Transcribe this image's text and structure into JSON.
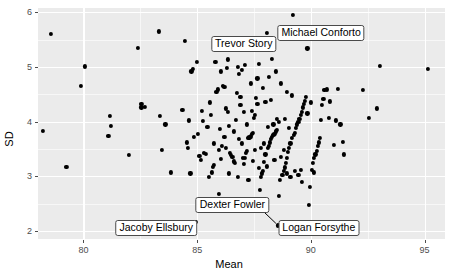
{
  "chart_data": {
    "type": "scatter",
    "title": "",
    "xlabel": "Mean",
    "ylabel": "SD",
    "xlim": [
      78.0,
      95.9
    ],
    "ylim": [
      1.85,
      6.08
    ],
    "xticks": [
      80,
      85,
      90,
      95
    ],
    "yticks": [
      2,
      3,
      4,
      5,
      6
    ],
    "xtick_labels": [
      "80",
      "85",
      "90",
      "95"
    ],
    "ytick_labels": [
      "2",
      "3",
      "4",
      "5",
      "6"
    ],
    "grid": true,
    "legend": "none",
    "panel_background": "#ebebeb",
    "grid_color": "#ffffff",
    "point_color": "#000000",
    "annotations": [
      {
        "label": "Trevor Story",
        "x": 87.05,
        "y": 5.42,
        "point_x": 88.05,
        "point_y": 5.63,
        "leader": false
      },
      {
        "label": "Michael Conforto",
        "x": 90.45,
        "y": 5.62,
        "point_x": 89.2,
        "point_y": 5.96,
        "leader": false
      },
      {
        "label": "Dexter Fowler",
        "x": 86.55,
        "y": 2.47,
        "point_x": 88.55,
        "point_y": 2.1,
        "leader": true
      },
      {
        "label": "Jacoby Ellsbury",
        "x": 83.2,
        "y": 2.06,
        "point_x": 84.95,
        "point_y": 2.16,
        "leader": false
      },
      {
        "label": "Logan Forsythe",
        "x": 90.35,
        "y": 2.06,
        "point_x": 88.7,
        "point_y": 2.1,
        "leader": false
      }
    ],
    "points": [
      [
        78.55,
        5.61
      ],
      [
        78.2,
        3.83
      ],
      [
        79.25,
        3.17
      ],
      [
        80.05,
        5.01
      ],
      [
        79.9,
        4.66
      ],
      [
        81.15,
        4.11
      ],
      [
        81.2,
        3.92
      ],
      [
        81.1,
        3.74
      ],
      [
        82.0,
        3.39
      ],
      [
        82.4,
        5.35
      ],
      [
        82.55,
        4.32
      ],
      [
        82.7,
        4.27
      ],
      [
        82.55,
        4.26
      ],
      [
        83.3,
        5.65
      ],
      [
        83.35,
        4.1
      ],
      [
        83.45,
        3.48
      ],
      [
        83.6,
        3.95
      ],
      [
        83.85,
        3.07
      ],
      [
        84.35,
        4.21
      ],
      [
        84.45,
        5.48
      ],
      [
        84.55,
        3.62
      ],
      [
        84.6,
        3.52
      ],
      [
        84.65,
        4.02
      ],
      [
        84.7,
        3.05
      ],
      [
        84.75,
        4.92
      ],
      [
        84.8,
        4.97
      ],
      [
        84.85,
        3.72
      ],
      [
        84.95,
        2.16
      ],
      [
        85.0,
        5.09
      ],
      [
        85.05,
        3.78
      ],
      [
        85.1,
        3.37
      ],
      [
        85.15,
        3.3
      ],
      [
        85.2,
        4.2
      ],
      [
        85.25,
        4.01
      ],
      [
        85.3,
        3.43
      ],
      [
        85.4,
        3.41
      ],
      [
        85.45,
        3.9
      ],
      [
        85.55,
        4.35
      ],
      [
        85.6,
        4.12
      ],
      [
        85.65,
        3.07
      ],
      [
        85.7,
        3.17
      ],
      [
        85.75,
        3.2
      ],
      [
        85.8,
        5.1
      ],
      [
        85.85,
        4.55
      ],
      [
        85.9,
        4.59
      ],
      [
        85.95,
        2.68
      ],
      [
        86.0,
        3.86
      ],
      [
        86.05,
        3.32
      ],
      [
        86.1,
        3.55
      ],
      [
        86.15,
        4.66
      ],
      [
        86.2,
        4.64
      ],
      [
        86.25,
        4.24
      ],
      [
        86.3,
        4.98
      ],
      [
        86.35,
        5.14
      ],
      [
        86.4,
        3.05
      ],
      [
        86.45,
        3.42
      ],
      [
        86.5,
        3.39
      ],
      [
        86.55,
        3.36
      ],
      [
        86.6,
        3.27
      ],
      [
        86.65,
        3.24
      ],
      [
        86.7,
        4.03
      ],
      [
        86.75,
        4.52
      ],
      [
        86.8,
        5.0
      ],
      [
        86.85,
        4.88
      ],
      [
        86.9,
        4.3
      ],
      [
        86.95,
        3.6
      ],
      [
        87.0,
        3.33
      ],
      [
        87.05,
        3.22
      ],
      [
        87.1,
        3.34
      ],
      [
        87.15,
        3.42
      ],
      [
        87.2,
        3.47
      ],
      [
        87.25,
        3.7
      ],
      [
        87.3,
        3.71
      ],
      [
        87.35,
        3.73
      ],
      [
        87.4,
        3.77
      ],
      [
        87.45,
        3.8
      ],
      [
        87.5,
        4.06
      ],
      [
        87.55,
        4.12
      ],
      [
        87.6,
        4.44
      ],
      [
        87.65,
        4.79
      ],
      [
        87.7,
        5.06
      ],
      [
        87.75,
        2.75
      ],
      [
        87.8,
        2.98
      ],
      [
        87.85,
        3.05
      ],
      [
        87.9,
        3.1
      ],
      [
        87.95,
        3.26
      ],
      [
        88.0,
        3.4
      ],
      [
        88.05,
        5.63
      ],
      [
        88.1,
        3.52
      ],
      [
        88.15,
        3.55
      ],
      [
        88.2,
        3.62
      ],
      [
        88.25,
        3.68
      ],
      [
        88.3,
        3.72
      ],
      [
        88.35,
        3.75
      ],
      [
        88.4,
        3.78
      ],
      [
        88.45,
        3.82
      ],
      [
        88.5,
        3.85
      ],
      [
        88.55,
        2.1
      ],
      [
        88.6,
        2.64
      ],
      [
        88.65,
        2.93
      ],
      [
        88.7,
        2.1
      ],
      [
        88.75,
        3.02
      ],
      [
        88.8,
        3.09
      ],
      [
        88.85,
        3.16
      ],
      [
        88.9,
        3.25
      ],
      [
        88.95,
        3.33
      ],
      [
        89.0,
        3.45
      ],
      [
        89.05,
        3.52
      ],
      [
        89.1,
        3.6
      ],
      [
        89.15,
        3.7
      ],
      [
        89.2,
        5.96
      ],
      [
        89.25,
        3.75
      ],
      [
        89.3,
        3.8
      ],
      [
        89.35,
        3.88
      ],
      [
        89.4,
        3.95
      ],
      [
        89.45,
        4.0
      ],
      [
        89.5,
        4.05
      ],
      [
        89.55,
        4.12
      ],
      [
        89.6,
        4.18
      ],
      [
        89.65,
        4.26
      ],
      [
        89.7,
        4.32
      ],
      [
        89.75,
        4.38
      ],
      [
        89.8,
        4.45
      ],
      [
        89.85,
        5.34
      ],
      [
        89.9,
        2.47
      ],
      [
        89.95,
        2.8
      ],
      [
        90.05,
        3.12
      ],
      [
        90.1,
        3.25
      ],
      [
        90.15,
        3.33
      ],
      [
        90.2,
        3.4
      ],
      [
        90.25,
        3.47
      ],
      [
        90.3,
        3.56
      ],
      [
        90.35,
        3.62
      ],
      [
        90.4,
        3.7
      ],
      [
        90.45,
        4.03
      ],
      [
        90.5,
        4.3
      ],
      [
        90.55,
        4.42
      ],
      [
        90.6,
        4.58
      ],
      [
        90.7,
        4.59
      ],
      [
        90.8,
        4.07
      ],
      [
        91.0,
        3.57
      ],
      [
        91.1,
        4.02
      ],
      [
        91.2,
        4.6
      ],
      [
        91.3,
        3.95
      ],
      [
        91.4,
        3.63
      ],
      [
        92.3,
        4.58
      ],
      [
        92.55,
        4.07
      ],
      [
        92.9,
        4.24
      ],
      [
        93.05,
        5.02
      ],
      [
        95.15,
        4.96
      ],
      [
        86.35,
        4.18
      ],
      [
        86.9,
        4.45
      ],
      [
        87.05,
        4.18
      ],
      [
        87.4,
        4.2
      ],
      [
        87.65,
        4.33
      ],
      [
        88.0,
        4.36
      ],
      [
        88.25,
        4.4
      ],
      [
        88.5,
        4.05
      ],
      [
        88.7,
        3.35
      ],
      [
        88.95,
        3.05
      ],
      [
        89.3,
        3.1
      ],
      [
        89.55,
        3.12
      ],
      [
        89.1,
        2.98
      ],
      [
        87.8,
        3.52
      ],
      [
        87.95,
        3.6
      ],
      [
        88.1,
        3.9
      ],
      [
        88.35,
        3.95
      ],
      [
        88.6,
        4.0
      ],
      [
        88.85,
        4.05
      ],
      [
        87.55,
        3.48
      ],
      [
        87.2,
        3.95
      ],
      [
        86.85,
        3.68
      ],
      [
        86.6,
        3.82
      ],
      [
        86.4,
        3.92
      ],
      [
        86.2,
        3.72
      ],
      [
        85.95,
        3.48
      ],
      [
        85.75,
        3.6
      ],
      [
        88.15,
        4.82
      ],
      [
        88.45,
        4.92
      ],
      [
        88.3,
        5.15
      ],
      [
        88.7,
        4.7
      ],
      [
        88.95,
        4.55
      ],
      [
        89.15,
        4.48
      ],
      [
        87.9,
        4.62
      ],
      [
        87.35,
        4.7
      ],
      [
        87.1,
        5.04
      ],
      [
        86.95,
        4.94
      ],
      [
        89.85,
        4.15
      ],
      [
        90.0,
        4.35
      ],
      [
        88.8,
        3.48
      ],
      [
        89.05,
        3.88
      ],
      [
        88.4,
        3.3
      ],
      [
        88.05,
        3.18
      ],
      [
        87.7,
        3.15
      ],
      [
        87.45,
        3.28
      ],
      [
        86.05,
        4.92
      ],
      [
        86.8,
        2.98
      ],
      [
        87.25,
        2.93
      ],
      [
        89.45,
        3.03
      ],
      [
        90.15,
        3.07
      ],
      [
        85.5,
        2.98
      ],
      [
        86.25,
        3.52
      ],
      [
        90.85,
        4.37
      ],
      [
        91.45,
        3.4
      ],
      [
        89.6,
        2.9
      ]
    ]
  }
}
